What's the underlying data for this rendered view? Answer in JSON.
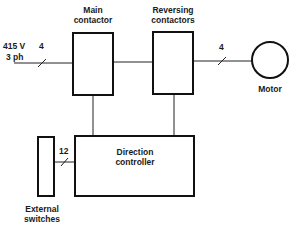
{
  "diagram": {
    "input": {
      "voltage": "415 V",
      "phase": "3 ph",
      "conductors": "4"
    },
    "blocks": {
      "main_contactor": {
        "line1": "Main",
        "line2": "contactor"
      },
      "reversing_contactors": {
        "line1": "Reversing",
        "line2": "contactors"
      },
      "motor": {
        "label": "Motor"
      },
      "direction_controller": {
        "line1": "Direction",
        "line2": "controller"
      },
      "external_switches": {
        "line1": "External",
        "line2": "switches"
      }
    },
    "motor_conductors": "4",
    "switch_conductors": "12"
  }
}
